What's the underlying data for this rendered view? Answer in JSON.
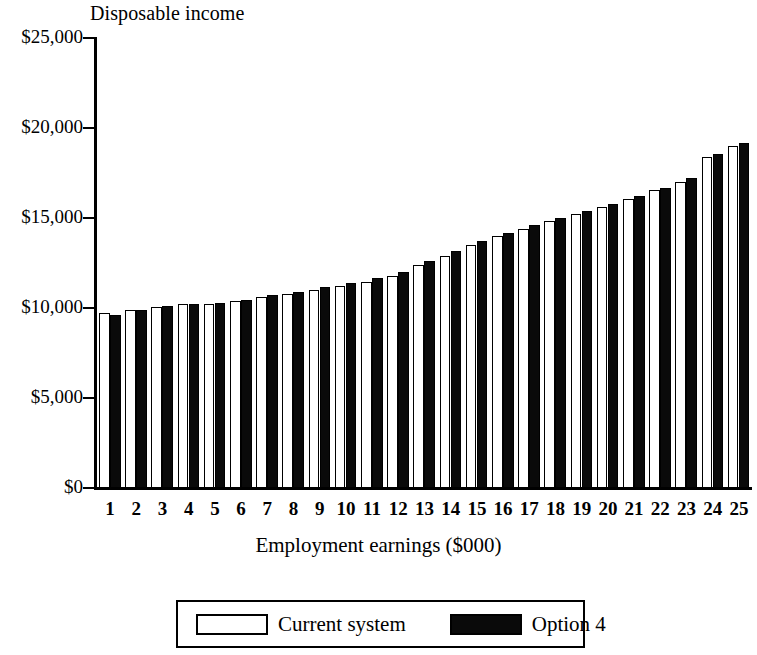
{
  "chart_data": {
    "type": "bar",
    "title": "",
    "ylabel": "Disposable income",
    "xlabel": "Employment earnings ($000)",
    "categories": [
      "1",
      "2",
      "3",
      "4",
      "5",
      "6",
      "7",
      "8",
      "9",
      "10",
      "11",
      "12",
      "13",
      "14",
      "15",
      "16",
      "17",
      "18",
      "19",
      "20",
      "21",
      "22",
      "23",
      "24",
      "25"
    ],
    "ylim": [
      0,
      25000
    ],
    "yticks": [
      0,
      5000,
      10000,
      15000,
      20000,
      25000
    ],
    "ytick_labels": [
      "$0",
      "$5,000",
      "$10,000",
      "$15,000",
      "$20,000",
      "$25,000"
    ],
    "grid": false,
    "legend_position": "bottom",
    "series": [
      {
        "name": "Current system",
        "color": "#ffffff",
        "values": [
          9700,
          9900,
          10050,
          10200,
          10250,
          10400,
          10600,
          10800,
          11000,
          11200,
          11450,
          11800,
          12400,
          12900,
          13500,
          14000,
          14400,
          14850,
          15250,
          15600,
          16050,
          16550,
          17000,
          18400,
          19000
        ]
      },
      {
        "name": "Option 4",
        "color": "#000000",
        "values": [
          9600,
          9900,
          10100,
          10250,
          10300,
          10450,
          10700,
          10900,
          11150,
          11400,
          11650,
          12000,
          12600,
          13150,
          13700,
          14150,
          14600,
          15000,
          15400,
          15800,
          16200,
          16650,
          17200,
          18550,
          19150
        ]
      }
    ]
  },
  "axes": {
    "y_title": "Disposable income",
    "x_title": "Employment earnings ($000)"
  },
  "legend": {
    "entries": [
      {
        "label": "Current system",
        "swatch": "white-swatch"
      },
      {
        "label": "Option 4",
        "swatch": "black-swatch"
      }
    ]
  }
}
